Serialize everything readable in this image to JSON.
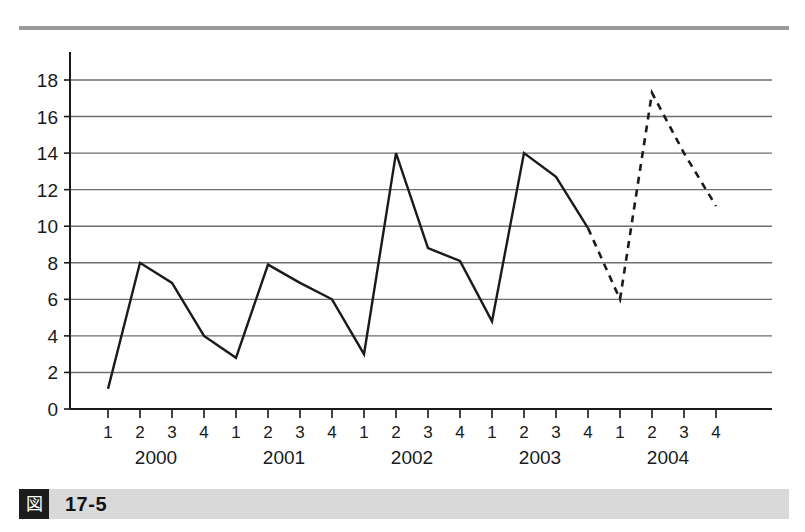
{
  "figure": {
    "badge_glyph": "図",
    "number": "17-5"
  },
  "chart_data": {
    "type": "line",
    "title": "",
    "subtitle": "",
    "xlabel": "",
    "ylabel": "",
    "grid": true,
    "legend": "none",
    "ylim": [
      0,
      19.5
    ],
    "y_ticks": [
      0,
      2,
      4,
      6,
      8,
      10,
      12,
      14,
      16,
      18
    ],
    "y_tick_labels": [
      "0",
      "2",
      "4",
      "6",
      "8",
      "10",
      "12",
      "14",
      "16",
      "18"
    ],
    "quarter_tick_labels": [
      "1",
      "2",
      "3",
      "4",
      "1",
      "2",
      "3",
      "4",
      "1",
      "2",
      "3",
      "4",
      "1",
      "2",
      "3",
      "4",
      "1",
      "2",
      "3",
      "4"
    ],
    "year_labels": [
      "2000",
      "2001",
      "2002",
      "2003",
      "2004"
    ],
    "x": [
      "2000-1",
      "2000-2",
      "2000-3",
      "2000-4",
      "2001-1",
      "2001-2",
      "2001-3",
      "2001-4",
      "2002-1",
      "2002-2",
      "2002-3",
      "2002-4",
      "2003-1",
      "2003-2",
      "2003-3",
      "2003-4",
      "2004-1",
      "2004-2",
      "2004-3",
      "2004-4"
    ],
    "series": [
      {
        "name": "actual",
        "style": "solid",
        "color": "#1a1a1a",
        "values": [
          1.1,
          8.0,
          6.9,
          4.0,
          2.8,
          7.9,
          6.9,
          6.0,
          3.0,
          14.0,
          8.8,
          8.1,
          4.8,
          14.0,
          12.7,
          9.9,
          null,
          null,
          null,
          null
        ]
      },
      {
        "name": "forecast",
        "style": "dashed",
        "color": "#1a1a1a",
        "values": [
          null,
          null,
          null,
          null,
          null,
          null,
          null,
          null,
          null,
          null,
          null,
          null,
          null,
          null,
          null,
          9.9,
          6.0,
          17.3,
          14.0,
          11.1
        ]
      }
    ]
  }
}
